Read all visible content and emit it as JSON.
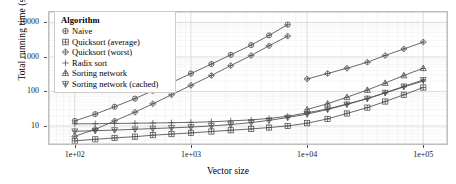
{
  "chart_data": {
    "type": "line",
    "title": "",
    "xlabel": "Vector size",
    "ylabel": "Total running time (s)",
    "xscale": "log10",
    "yscale": "log10",
    "xlim": [
      60,
      160000
    ],
    "ylim": [
      3,
      20000
    ],
    "xticks": [
      "1e+02",
      "1e+03",
      "1e+04",
      "1e+05"
    ],
    "xtickvalues": [
      100,
      1000,
      10000,
      100000
    ],
    "yticks": [
      "10",
      "100",
      "1000",
      "10000"
    ],
    "ytickvalues": [
      10,
      100,
      1000,
      10000
    ],
    "grid": true,
    "legend": {
      "title": "Algorithm",
      "position": "top-left-inside",
      "entries": [
        {
          "label": "Naive",
          "shape": "circle-plus",
          "color": "#4d4d4d"
        },
        {
          "label": "Quicksort (average)",
          "shape": "square-plus",
          "color": "#4d4d4d"
        },
        {
          "label": "Quicksort (worst)",
          "shape": "diamond-plus",
          "color": "#4d4d4d"
        },
        {
          "label": "Radix sort",
          "shape": "plus",
          "color": "#4d4d4d"
        },
        {
          "label": "Sorting network",
          "shape": "triangle-plus",
          "color": "#4d4d4d"
        },
        {
          "label": "Sorting network (cached)",
          "shape": "triangle-down-plus",
          "color": "#4d4d4d"
        }
      ]
    },
    "series": [
      {
        "name": "Naive",
        "shape": "circle-plus",
        "color": "#4d4d4d",
        "x": [
          100,
          150,
          220,
          330,
          470,
          680,
          1000,
          1500,
          2200,
          3300,
          4700,
          6800
        ],
        "y": [
          14,
          22,
          36,
          62,
          105,
          180,
          330,
          620,
          1150,
          2200,
          4200,
          8600
        ]
      },
      {
        "name": "Quicksort (average)",
        "shape": "square-plus",
        "color": "#4d4d4d",
        "x": [
          100,
          150,
          220,
          330,
          470,
          680,
          1000,
          1500,
          2200,
          3300,
          4700,
          6800,
          10000,
          15000,
          22000,
          33000,
          47000,
          68000,
          100000
        ],
        "y": [
          3.7,
          4.1,
          4.5,
          4.9,
          5.4,
          5.8,
          6.3,
          6.9,
          7.5,
          8.2,
          9.0,
          10.0,
          12.0,
          16.0,
          23.0,
          34.0,
          51.0,
          80.0,
          130.0
        ]
      },
      {
        "name": "Quicksort (worst)",
        "shape": "diamond-plus",
        "color": "#4d4d4d",
        "x": [
          100,
          150,
          220,
          330,
          470,
          680,
          1000,
          1500,
          2200,
          3300,
          4700,
          6800,
          10000,
          15000,
          22000,
          33000,
          47000,
          68000,
          100000
        ],
        "y": [
          5.0,
          8.0,
          14.0,
          25.0,
          44.0,
          80.0,
          150.0,
          290.0,
          560.0,
          1100.0,
          2100.0,
          4000.0,
          230.0,
          330.0,
          470.0,
          700.0,
          1100.0,
          1700.0,
          2700.0
        ]
      },
      {
        "name": "Radix sort",
        "shape": "plus",
        "color": "#4d4d4d",
        "x": [
          100,
          150,
          220,
          330,
          470,
          680,
          1000,
          1500,
          2200,
          3300,
          4700,
          6800,
          10000,
          15000,
          22000,
          33000,
          47000,
          68000,
          100000
        ],
        "y": [
          11.5,
          11.6,
          11.8,
          12.0,
          12.2,
          12.4,
          12.7,
          13.2,
          14.0,
          15.0,
          16.5,
          19.0,
          24.0,
          31.0,
          43.0,
          62.0,
          90.0,
          135.0,
          200.0
        ]
      },
      {
        "name": "Sorting network",
        "shape": "triangle-plus",
        "color": "#4d4d4d",
        "x": [
          10000,
          15000,
          22000,
          33000,
          47000,
          68000,
          100000
        ],
        "y": [
          30.0,
          44.0,
          68.0,
          110.0,
          175.0,
          290.0,
          470.0
        ]
      },
      {
        "name": "Sorting network (cached)",
        "shape": "triangle-down-plus",
        "color": "#4d4d4d",
        "x": [
          100,
          150,
          220,
          330,
          470,
          680,
          1000,
          1500,
          2200,
          3300,
          4700,
          6800,
          10000,
          15000,
          22000,
          33000,
          47000,
          68000,
          100000
        ],
        "y": [
          7.0,
          7.3,
          7.6,
          8.0,
          8.4,
          8.8,
          9.3,
          10.0,
          11.0,
          12.5,
          14.5,
          17.5,
          22.0,
          30.0,
          42.0,
          62.0,
          92.0,
          140.0,
          215.0
        ]
      }
    ]
  },
  "colors": {
    "panel_background": "#ffffff",
    "grid_major": "#d9d9d9",
    "grid_minor": "#ececec",
    "panel_border": "#bfbfbf",
    "series": "#4d4d4d",
    "text": "#000000"
  }
}
